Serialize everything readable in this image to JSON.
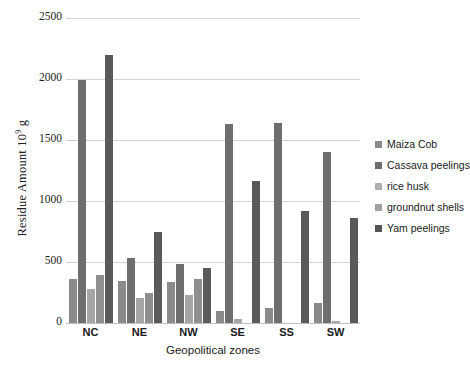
{
  "chart_data": {
    "type": "bar",
    "title": "",
    "xlabel": "Geopolitical zones",
    "ylabel": "Residue Amount 10⁹ g",
    "ylabel_prefix": "Residue Amount 10",
    "ylabel_exponent": "9",
    "ylabel_suffix": " g",
    "categories": [
      "NC",
      "NE",
      "NW",
      "SE",
      "SS",
      "SW"
    ],
    "ylim": [
      0,
      2500
    ],
    "yticks": [
      2500,
      2000,
      1500,
      1000,
      500,
      0
    ],
    "yticks_labels": [
      "2500",
      "2000",
      "1500",
      "1000",
      "500",
      "0"
    ],
    "grid": true,
    "legend_position": "right",
    "series": [
      {
        "name": "Maiza Cob",
        "color": "#7d7d7d",
        "values": [
          360,
          345,
          335,
          0,
          0,
          165
        ]
      },
      {
        "name": "Cassava peelings",
        "color": "#6a6a6a",
        "values": [
          0,
          530,
          485,
          100,
          120,
          0
        ]
      },
      {
        "name": "rice husk",
        "color": "#9a9a9a",
        "values": [
          1990,
          0,
          0,
          0,
          0,
          0
        ]
      },
      {
        "name": "groundnut shells",
        "color": "#a8a8a8",
        "values": [
          280,
          205,
          230,
          0,
          0,
          20
        ]
      },
      {
        "name": "Yam peelings",
        "color": "#5a5a5a",
        "values": [
          2200,
          745,
          455,
          1635,
          1640,
          1400
        ]
      }
    ],
    "group_bars": [
      {
        "zone": "NC",
        "bars": [
          {
            "series": "Maiza Cob",
            "value": 360,
            "color": "#8a8a8a"
          },
          {
            "series": "rice husk",
            "value": 1990,
            "color": "#6e6e6e"
          },
          {
            "series": "groundnut shells",
            "value": 280,
            "color": "#a6a6a6"
          },
          {
            "series": "Cassava peelings",
            "value": 390,
            "color": "#8f8f8f"
          },
          {
            "series": "Yam peelings",
            "value": 2200,
            "color": "#5a5a5a"
          }
        ]
      },
      {
        "zone": "NE",
        "bars": [
          {
            "series": "Maiza Cob",
            "value": 345,
            "color": "#8a8a8a"
          },
          {
            "series": "Cassava peelings",
            "value": 530,
            "color": "#6e6e6e"
          },
          {
            "series": "rice husk",
            "value": 205,
            "color": "#a6a6a6"
          },
          {
            "series": "groundnut shells",
            "value": 250,
            "color": "#8f8f8f"
          },
          {
            "series": "Yam peelings",
            "value": 745,
            "color": "#5a5a5a"
          }
        ]
      },
      {
        "zone": "NW",
        "bars": [
          {
            "series": "Maiza Cob",
            "value": 335,
            "color": "#8a8a8a"
          },
          {
            "series": "Cassava peelings",
            "value": 485,
            "color": "#6e6e6e"
          },
          {
            "series": "rice husk",
            "value": 230,
            "color": "#a6a6a6"
          },
          {
            "series": "groundnut shells",
            "value": 360,
            "color": "#8f8f8f"
          },
          {
            "series": "Yam peelings",
            "value": 455,
            "color": "#5a5a5a"
          }
        ]
      },
      {
        "zone": "SE",
        "bars": [
          {
            "series": "Maiza Cob",
            "value": 100,
            "color": "#8a8a8a"
          },
          {
            "series": "Cassava peelings",
            "value": 1635,
            "color": "#6e6e6e"
          },
          {
            "series": "rice husk",
            "value": 35,
            "color": "#a6a6a6"
          },
          {
            "series": "groundnut shells",
            "value": 0,
            "color": "#8f8f8f"
          },
          {
            "series": "Yam peelings",
            "value": 1160,
            "color": "#5a5a5a"
          }
        ]
      },
      {
        "zone": "SS",
        "bars": [
          {
            "series": "Maiza Cob",
            "value": 120,
            "color": "#8a8a8a"
          },
          {
            "series": "Cassava peelings",
            "value": 1640,
            "color": "#6e6e6e"
          },
          {
            "series": "rice husk",
            "value": 0,
            "color": "#a6a6a6"
          },
          {
            "series": "groundnut shells",
            "value": 0,
            "color": "#8f8f8f"
          },
          {
            "series": "Yam peelings",
            "value": 915,
            "color": "#5a5a5a"
          }
        ]
      },
      {
        "zone": "SW",
        "bars": [
          {
            "series": "Maiza Cob",
            "value": 165,
            "color": "#8a8a8a"
          },
          {
            "series": "Cassava peelings",
            "value": 1400,
            "color": "#6e6e6e"
          },
          {
            "series": "rice husk",
            "value": 20,
            "color": "#a6a6a6"
          },
          {
            "series": "groundnut shells",
            "value": 0,
            "color": "#8f8f8f"
          },
          {
            "series": "Yam peelings",
            "value": 860,
            "color": "#5a5a5a"
          }
        ]
      }
    ]
  },
  "legend": {
    "items": [
      {
        "label": "Maiza Cob",
        "color": "#8a8a8a"
      },
      {
        "label": "Cassava peelings",
        "color": "#6e6e6e"
      },
      {
        "label": "rice husk",
        "color": "#b0b0b0"
      },
      {
        "label": "groundnut shells",
        "color": "#a0a0a0"
      },
      {
        "label": "Yam peelings",
        "color": "#555555"
      }
    ]
  }
}
